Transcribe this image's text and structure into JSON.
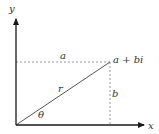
{
  "diagram": {
    "axes": {
      "x_label": "x",
      "y_label": "y"
    },
    "point_label": "a + bi",
    "horizontal_label": "a",
    "vertical_label": "b",
    "radius_label": "r",
    "angle_label": "θ",
    "colors": {
      "axis": "#1a1a1a",
      "radius_line": "#555555",
      "dashed": "#999999",
      "text": "#333333"
    }
  }
}
